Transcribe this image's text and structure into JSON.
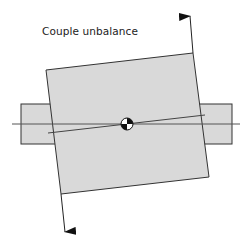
{
  "title": "Couple unbalance",
  "colors": {
    "rotor_fill": "#d9d9d9",
    "shaft_fill": "#d9d9d9",
    "stroke": "#333333",
    "background": "#ffffff"
  },
  "diagram": {
    "type": "rotor-unbalance",
    "elements": [
      "shaft",
      "rotor-disk-tilted",
      "bearing-axis",
      "principal-inertia-axis",
      "center-of-mass-symbol",
      "force-arrow-up",
      "force-arrow-down"
    ]
  }
}
